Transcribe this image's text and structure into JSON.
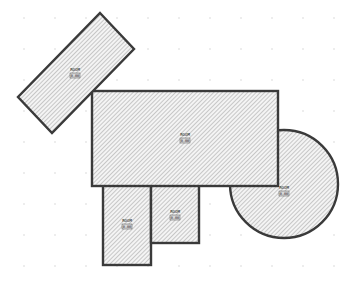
{
  "diagram": {
    "type": "floor-plan",
    "background": "#ffffff",
    "stroke_color": "#3a3a3a",
    "hatch_color": "#9a9a9a",
    "grid": {
      "spacing": 31,
      "offset_x": 24,
      "offset_y": 18,
      "dot_color": "#d6d6d6"
    }
  },
  "rooms": [
    {
      "id": "rotated-rect",
      "shape": "rotated-rectangle",
      "label": "ROOM",
      "code": "0.00"
    },
    {
      "id": "main-rect",
      "shape": "rectangle",
      "label": "ROOM",
      "code": "0.00"
    },
    {
      "id": "circle",
      "shape": "circle",
      "label": "ROOM",
      "code": "0.00"
    },
    {
      "id": "lower-left",
      "shape": "rectangle",
      "label": "ROOM",
      "code": "0.00"
    },
    {
      "id": "lower-mid",
      "shape": "rectangle",
      "label": "ROOM",
      "code": "0.00"
    }
  ]
}
